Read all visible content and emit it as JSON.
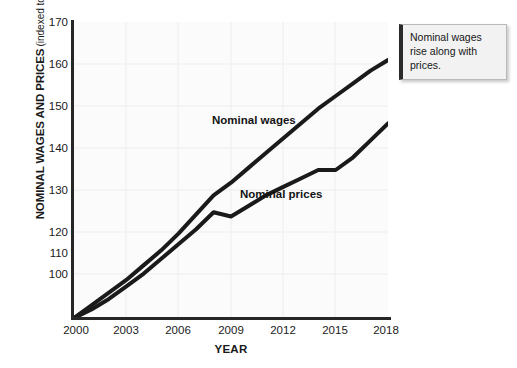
{
  "chart_data": {
    "type": "line",
    "title": "",
    "xlabel": "YEAR",
    "ylabel": "NOMINAL WAGES AND PRICES",
    "ylabel_sub": "(indexed to 2000 = 100)",
    "xlim": [
      2000,
      2018
    ],
    "ylim": [
      100,
      170
    ],
    "xticks": [
      2000,
      2003,
      2006,
      2009,
      2012,
      2015,
      2018
    ],
    "yticks": [
      100,
      110,
      120,
      130,
      140,
      150,
      160,
      170
    ],
    "grid": true,
    "legend_position": "inline-labels",
    "x": [
      2000,
      2001,
      2002,
      2003,
      2004,
      2005,
      2006,
      2007,
      2008,
      2009,
      2010,
      2011,
      2012,
      2013,
      2014,
      2015,
      2016,
      2017,
      2018
    ],
    "series": [
      {
        "name": "Nominal wages",
        "color": "#1a1a1a",
        "values": [
          100,
          103,
          106,
          109,
          112.5,
          116,
          120,
          124.5,
          129,
          132,
          135.5,
          139,
          142.5,
          146,
          149.5,
          152.5,
          155.5,
          158.5,
          161
        ]
      },
      {
        "name": "Nominal prices",
        "color": "#1a1a1a",
        "values": [
          100,
          102,
          104.5,
          107.5,
          110.5,
          114,
          117.5,
          121,
          125,
          124,
          126.5,
          129,
          131,
          133,
          135,
          135,
          138,
          142,
          146
        ]
      }
    ],
    "annotations": [
      {
        "name": "callout",
        "text": "Nominal wages rise along with prices."
      }
    ]
  },
  "axis": {
    "ytick_labels": [
      "170",
      "160",
      "150",
      "140",
      "130",
      "120",
      "110",
      "100"
    ],
    "xtick_labels": [
      "2000",
      "2003",
      "2006",
      "2009",
      "2012",
      "2015",
      "2018"
    ],
    "x_title": "YEAR",
    "y_title_main": "NOMINAL WAGES AND PRICES",
    "y_title_sub": "(indexed to 2000 = 100)"
  },
  "labels": {
    "wages": "Nominal wages",
    "prices": "Nominal prices"
  },
  "callout": {
    "text": "Nominal wages rise along with prices."
  },
  "colors": {
    "line": "#1a1a1a",
    "axis": "#262626",
    "plot_background": "#fbfbfb",
    "grid": "#ececec",
    "callout_background": "#f2f2f2",
    "callout_accent": "#2b2b2b"
  }
}
